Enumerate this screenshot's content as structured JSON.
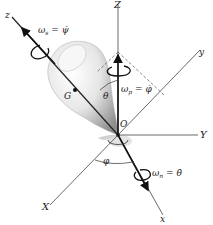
{
  "diagram": {
    "type": "rigid-body rotation (Euler angles) diagram",
    "axes": {
      "Z": "Z",
      "Y": "Y",
      "X": "X",
      "z": "z",
      "y": "y",
      "x": "x"
    },
    "points": {
      "origin": "O",
      "center_of_mass": "G"
    },
    "angles": {
      "theta": "θ",
      "phi": "φ"
    },
    "angular_velocities": {
      "spin": {
        "symbol": "ω",
        "sub": "s",
        "eq": " = ",
        "rhs": "ψ̇"
      },
      "precession": {
        "symbol": "ω",
        "sub": "p",
        "eq": " = ",
        "rhs": "φ̇"
      },
      "nutation": {
        "symbol": "ω",
        "sub": "n",
        "eq": " = ",
        "rhs": "θ̇"
      }
    },
    "colors": {
      "line": "#333333",
      "body_light": "#f2f2f2",
      "body_dark": "#9a9a9a"
    }
  }
}
